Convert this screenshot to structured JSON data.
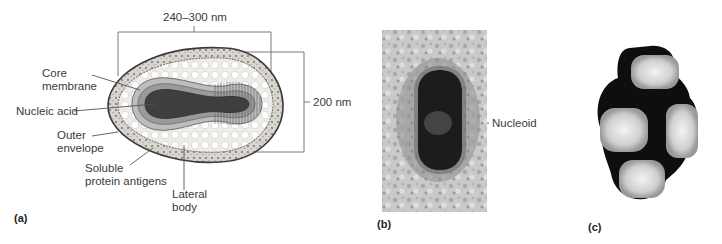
{
  "figure": {
    "panels": [
      {
        "id": "a",
        "label": "(a)",
        "type": "illustration",
        "subject": "virion cross-section diagram"
      },
      {
        "id": "b",
        "label": "(b)",
        "type": "micrograph",
        "subject": "thin-section electron micrograph"
      },
      {
        "id": "c",
        "label": "(c)",
        "type": "micrograph",
        "subject": "negatively stained virions"
      }
    ],
    "panel_a": {
      "dimension_width": "240–300 nm",
      "dimension_height": "200 nm",
      "labels": {
        "core_membrane_1": "Core",
        "core_membrane_2": "membrane",
        "nucleic_acid": "Nucleic acid",
        "outer_envelope_1": "Outer",
        "outer_envelope_2": "envelope",
        "soluble_1": "Soluble",
        "soluble_2": "protein antigens",
        "lateral_1": "Lateral",
        "lateral_2": "body"
      }
    },
    "panel_b": {
      "labels": {
        "nucleoid": "Nucleoid"
      }
    },
    "colors": {
      "outer_envelope_fill": "#d9d6cf",
      "envelope_stroke": "#3a3a3a",
      "lateral_body": "#f2f1ee",
      "core_membrane": "#b5b5b5",
      "core_inner": "#8e8e8e",
      "nucleic_acid": "#4a4a4a",
      "leader_line": "#555555",
      "micrograph_bg": "#c8c8c8",
      "micrograph_dark": "#1a1a1a"
    }
  }
}
